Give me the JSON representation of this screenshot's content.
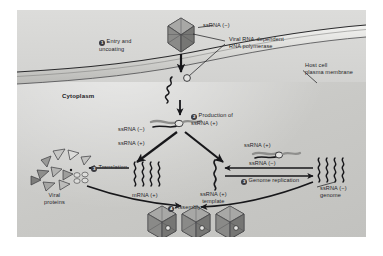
{
  "figure": {
    "background_color": "#cfcfcd",
    "ink_color": "#17171a"
  },
  "labels": {
    "ssrna_minus_virion": "ssRNA (−)",
    "polymerase": "Viral RNA-dependent\nRNA polymerase",
    "host_membrane": "Host cell\nplasma membrane",
    "cytoplasm": "Cytoplasm",
    "ssrna_minus_template": "ssRNA (−)",
    "ssrna_plus_branch": "ssRNA (+)",
    "mrna_plus": "mRNA (+)",
    "viral_proteins": "Viral\nproteins",
    "ssrna_plus_template": "ssRNA (+)\ntemplate",
    "ssrna_plus_replication": "ssRNA (+)",
    "ssrna_minus_replication": "ssRNA (−)",
    "ssrna_minus_genome": "ssRNA (−)\ngenome"
  },
  "steps": [
    {
      "number": "1",
      "glyph": "①",
      "label": "Entry and\nuncoating"
    },
    {
      "number": "2",
      "glyph": "②",
      "label": "Production of\nssRNA (+)"
    },
    {
      "number": "3",
      "glyph": "③",
      "label": "Translation"
    },
    {
      "number": "3",
      "glyph": "③",
      "label": "Genome replication"
    },
    {
      "number": "4",
      "glyph": "④",
      "label": "Assembly"
    }
  ],
  "structures": {
    "virion_top": "icosahedral-virion",
    "virions_assembled_count": 3,
    "rna_strand": "wavy-rna-strand",
    "polymerase_particle": "polymerase-ball",
    "protein_triangle": "viral-protein-triangle"
  }
}
